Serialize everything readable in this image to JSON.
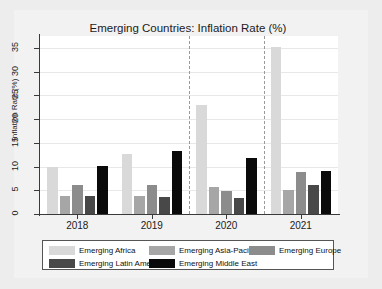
{
  "chart_data": {
    "type": "bar",
    "title": "Emerging Countries: Inflation Rate (%)",
    "xlabel": "",
    "ylabel": "Inflation Rate (%)",
    "categories": [
      "2018",
      "2019",
      "2020",
      "2021"
    ],
    "ylim": [
      0,
      37.5
    ],
    "yticks": [
      0,
      5,
      10,
      15,
      20,
      25,
      30,
      35
    ],
    "ytick_labels": [
      "0",
      "5",
      "10",
      "15",
      "20",
      "25",
      "30",
      "35"
    ],
    "grid": true,
    "legend_position": "bottom",
    "group_separators": [
      "between 2019 and 2020",
      "between 2020 and 2021"
    ],
    "series": [
      {
        "name": "Emerging Africa",
        "color": "#d9d9d9",
        "values": [
          10.0,
          12.6,
          23.0,
          35.2
        ]
      },
      {
        "name": "Emerging Asia-Pacific",
        "color": "#a6a6a6",
        "values": [
          3.7,
          3.9,
          5.6,
          5.1
        ]
      },
      {
        "name": "Emerging Europe",
        "color": "#8c8c8c",
        "values": [
          6.1,
          6.2,
          4.9,
          8.9
        ]
      },
      {
        "name": "Emerging Latin America",
        "color": "#484848",
        "values": [
          3.8,
          3.6,
          3.3,
          6.2
        ]
      },
      {
        "name": "Emerging Middle East",
        "color": "#0a0a0a",
        "values": [
          10.2,
          13.3,
          11.8,
          9.0
        ]
      }
    ]
  },
  "figure": {
    "background_color": "#ededed",
    "plot_background_color": "#ffffff",
    "axis_color": "#3a3a3a",
    "gridline_color": "#e8e8e8"
  }
}
